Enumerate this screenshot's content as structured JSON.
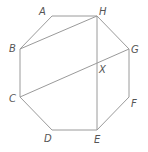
{
  "diagram": {
    "type": "geometry",
    "colors": {
      "line": "#9a9a9a",
      "label": "#555555"
    },
    "vertices": [
      "A",
      "B",
      "C",
      "D",
      "E",
      "F",
      "G",
      "H"
    ],
    "labels": {
      "A": "A",
      "B": "B",
      "C": "C",
      "D": "D",
      "E": "E",
      "F": "F",
      "G": "G",
      "H": "H",
      "X": "X"
    },
    "polygon_order": [
      "A",
      "H",
      "G",
      "F",
      "E",
      "D",
      "C",
      "B"
    ],
    "segments": [
      [
        "B",
        "H"
      ],
      [
        "C",
        "G"
      ],
      [
        "H",
        "E"
      ]
    ],
    "intersections": [
      {
        "name": "X",
        "of": [
          [
            "C",
            "G"
          ],
          [
            "H",
            "E"
          ]
        ]
      }
    ]
  }
}
